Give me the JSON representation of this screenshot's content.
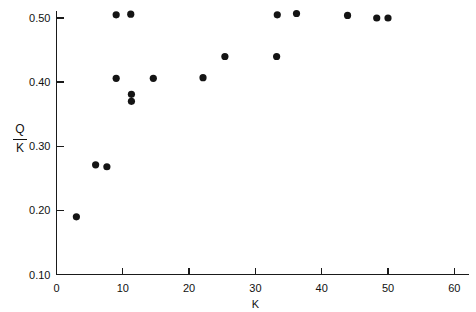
{
  "chart_data": {
    "type": "scatter",
    "title": "",
    "xlabel": "K",
    "ylabel": "Q/K",
    "ylabel_numerator": "Q",
    "ylabel_denominator": "K",
    "xlim": [
      0,
      62
    ],
    "ylim": [
      0.1,
      0.52
    ],
    "xticks": [
      0,
      10,
      20,
      30,
      40,
      50,
      60
    ],
    "xtick_labels": [
      "0",
      "10",
      "20",
      "30",
      "40",
      "50",
      "60"
    ],
    "yticks": [
      0.1,
      0.2,
      0.3,
      0.4,
      0.5
    ],
    "ytick_labels": [
      "0.10",
      "0.20",
      "0.30",
      "0.40",
      "0.50"
    ],
    "grid": false,
    "legend": null,
    "marker": "filled-circle",
    "marker_color": "#141414",
    "marker_size_px": 3.6,
    "points": [
      {
        "x": 3.0,
        "y": 0.19
      },
      {
        "x": 5.9,
        "y": 0.271
      },
      {
        "x": 7.6,
        "y": 0.268
      },
      {
        "x": 9.0,
        "y": 0.406
      },
      {
        "x": 9.0,
        "y": 0.505
      },
      {
        "x": 11.2,
        "y": 0.506
      },
      {
        "x": 11.3,
        "y": 0.381
      },
      {
        "x": 11.3,
        "y": 0.37
      },
      {
        "x": 14.6,
        "y": 0.406
      },
      {
        "x": 22.1,
        "y": 0.407
      },
      {
        "x": 25.4,
        "y": 0.44
      },
      {
        "x": 33.2,
        "y": 0.44
      },
      {
        "x": 33.3,
        "y": 0.505
      },
      {
        "x": 36.2,
        "y": 0.507
      },
      {
        "x": 43.9,
        "y": 0.504
      },
      {
        "x": 48.3,
        "y": 0.5
      },
      {
        "x": 50.0,
        "y": 0.5
      }
    ]
  },
  "axes": {
    "x_axis_name": "K",
    "y_axis_name": "Q/K"
  }
}
